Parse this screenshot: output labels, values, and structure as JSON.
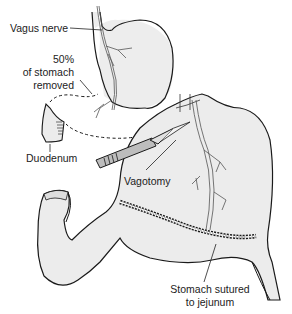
{
  "diagram": {
    "labels": {
      "vagus_nerve": "Vagus nerve",
      "removed_line1": "50%",
      "removed_line2": "of stomach",
      "removed_line3": "removed",
      "duodenum": "Duodenum",
      "vagotomy": "Vagotomy",
      "sutured_line1": "Stomach sutured",
      "sutured_line2": "to jejunum"
    },
    "colors": {
      "outline": "#1a1a1a",
      "organ_fill": "#ededed",
      "nerve": "#555555",
      "text": "#222222",
      "background": "#ffffff"
    }
  }
}
